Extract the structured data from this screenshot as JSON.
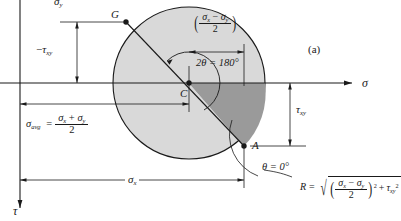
{
  "figure": {
    "caption": "(a)",
    "type": "mohrs-circle"
  },
  "axes": {
    "horizontal_label": "σ",
    "vertical_label": "τ"
  },
  "points": {
    "G": "G",
    "C": "C",
    "A": "A"
  },
  "labels": {
    "sigma_y": {
      "base": "σ",
      "sub": "y"
    },
    "neg_tau_xy": {
      "prefix": "−",
      "base": "τ",
      "sub": "xy"
    },
    "tau_xy": {
      "base": "τ",
      "sub": "xy"
    },
    "sigma_x": {
      "base": "σ",
      "sub": "x"
    },
    "sigma_avg": {
      "base": "σ",
      "sub": "avg"
    },
    "equals": "=",
    "radius_symbol": "R",
    "plus": "+"
  },
  "expressions": {
    "sigma_avg_numerator": "σx + σy",
    "sigma_avg_denominator": "2",
    "half_diff_numerator": "σx − σy",
    "half_diff_denominator": "2",
    "two_theta": "2θ = 180°",
    "theta_zero": "θ = 0°",
    "R_formula": "R = sqrt( ((σx - σy)/2)^2 + τxy^2 )"
  },
  "geometry": {
    "center": {
      "x": 189,
      "y": 83
    },
    "radius": 76,
    "point_G": {
      "x": 126,
      "y": 22
    },
    "point_A": {
      "x": 244,
      "y": 146
    },
    "sigma_axis_y": 83,
    "tau_axis_x": 20,
    "two_theta_degrees": 180,
    "theta_degrees": 0
  },
  "colors": {
    "circle_fill": "#d9d9d9",
    "wedge_fill": "#9a9a9a",
    "stroke": "#1a1a1a",
    "background": "#ffffff"
  }
}
